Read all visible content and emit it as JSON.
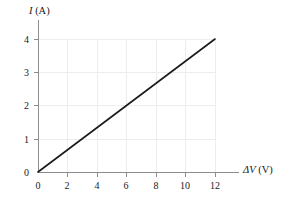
{
  "chart_data": {
    "type": "line",
    "title": "",
    "subtitle": "",
    "xlabel": "ΔV (V)",
    "xlabel_symbol": "ΔV",
    "xlabel_unit": "(V)",
    "ylabel": "I (A)",
    "ylabel_symbol": "I",
    "ylabel_unit": "(A)",
    "xlim": [
      0,
      13.6
    ],
    "ylim": [
      0,
      4.6
    ],
    "xticks": [
      0,
      2,
      4,
      6,
      8,
      10,
      12
    ],
    "yticks": [
      0,
      1,
      2,
      3,
      4
    ],
    "xticklabels": [
      "0",
      "2",
      "4",
      "6",
      "8",
      "10",
      "12"
    ],
    "yticklabels": [
      "0",
      "1",
      "2",
      "3",
      "4"
    ],
    "grid": true,
    "legend": "none",
    "annotations": [],
    "series": [
      {
        "name": "current-vs-voltage",
        "color": "#1a1a1a",
        "x": [
          0,
          12
        ],
        "y": [
          0,
          4
        ],
        "slope": 0.3333,
        "intercept": 0,
        "points": [
          {
            "x": 0,
            "y": 0
          },
          {
            "x": 2,
            "y": 0.667
          },
          {
            "x": 4,
            "y": 1.333
          },
          {
            "x": 6,
            "y": 2
          },
          {
            "x": 8,
            "y": 2.667
          },
          {
            "x": 10,
            "y": 3.333
          },
          {
            "x": 12,
            "y": 4
          }
        ]
      }
    ]
  },
  "style": {
    "background": "#ffffff",
    "grid_color": "#ededed",
    "axis_color": "#8d8d8d",
    "line_color": "#1a1a1a",
    "text_color": "#1a1a1a"
  }
}
